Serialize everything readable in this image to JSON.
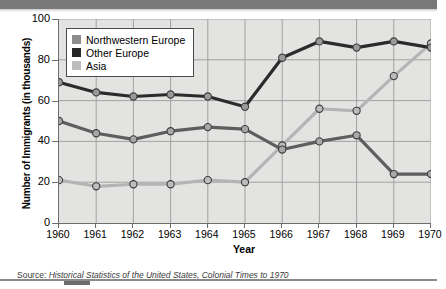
{
  "chart_data": {
    "type": "line",
    "title": "",
    "xlabel": "Year",
    "ylabel": "Number of Immigrants (in thousands)",
    "categories": [
      "1960",
      "1961",
      "1962",
      "1963",
      "1964",
      "1965",
      "1966",
      "1967",
      "1968",
      "1969",
      "1970"
    ],
    "x": [
      1960,
      1961,
      1962,
      1963,
      1964,
      1965,
      1966,
      1967,
      1968,
      1969,
      1970
    ],
    "ylim": [
      0,
      100
    ],
    "yticks": [
      "0",
      "20",
      "40",
      "60",
      "80",
      "100"
    ],
    "ytick_values": [
      0,
      20,
      40,
      60,
      80,
      100
    ],
    "grid": true,
    "legend_position": "top-left",
    "series": [
      {
        "name": "Northwestern Europe",
        "color": "#2b2b2b",
        "marker_color": "#9a9a9a",
        "values": [
          69,
          64,
          62,
          63,
          62,
          57,
          81,
          89,
          86,
          89,
          86
        ]
      },
      {
        "name": "Other Europe",
        "color": "#5e5e5e",
        "marker_color": "#a8a8a8",
        "values": [
          50,
          44,
          41,
          45,
          47,
          46,
          36,
          40,
          43,
          24,
          24
        ]
      },
      {
        "name": "Asia",
        "color": "#b4b4b4",
        "marker_color": "#bdbdbd",
        "values": [
          21,
          18,
          19,
          19,
          21,
          20,
          38,
          56,
          55,
          72,
          88
        ]
      }
    ]
  },
  "legend": {
    "items": [
      {
        "label": "Northwestern Europe",
        "swatch": "#8c8c8c"
      },
      {
        "label": "Other Europe",
        "swatch": "#262626"
      },
      {
        "label": "Asia",
        "swatch": "#bcbcbc"
      }
    ]
  },
  "source": {
    "label": "Source:",
    "title": "Historical Statistics of the United States, Colonial Times to 1970"
  }
}
